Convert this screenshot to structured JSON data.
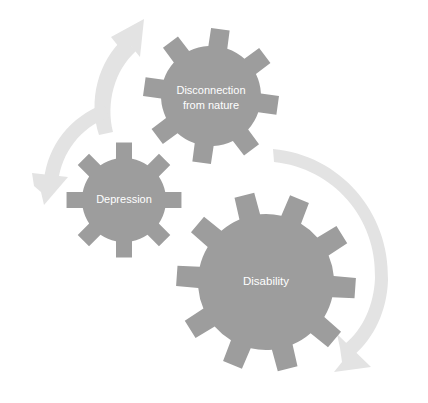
{
  "figure": {
    "name": "cycle-of-disconnection-depression-disability",
    "type": "cyclical-gear-diagram",
    "background_color": "#ffffff"
  },
  "colors": {
    "gear_fill": "#9d9d9d",
    "arrow_fill": "#e3e3e3",
    "label_text": "#ffffff"
  },
  "gears": [
    {
      "id": "gear-disconnection",
      "label": "Disconnection\nfrom nature",
      "label_line1": "Disconnection",
      "label_line2": "from nature",
      "teeth": 8,
      "center_x": 211,
      "center_y": 96,
      "body_radius": 50,
      "tooth_length": 18,
      "tooth_half_angle_deg": 11,
      "rotation_deg": 8,
      "size": "medium"
    },
    {
      "id": "gear-depression",
      "label": "Depression",
      "label_line1": "Depression",
      "label_line2": "",
      "teeth": 8,
      "center_x": 124,
      "center_y": 200,
      "body_radius": 42,
      "tooth_length": 16,
      "tooth_half_angle_deg": 11,
      "rotation_deg": 0,
      "size": "small"
    },
    {
      "id": "gear-disability",
      "label": "Disability",
      "label_line1": "Disability",
      "label_line2": "",
      "teeth": 10,
      "center_x": 266,
      "center_y": 282,
      "body_radius": 68,
      "tooth_length": 22,
      "tooth_half_angle_deg": 9,
      "rotation_deg": 4,
      "size": "large"
    }
  ],
  "arrows": [
    {
      "id": "arrow-depression-to-disconnection",
      "name": "arrow-up-right",
      "direction": "up-right",
      "start_x": 97,
      "start_y": 133,
      "end_x": 142,
      "end_y": 27
    },
    {
      "id": "arrow-disconnection-to-depression",
      "name": "arrow-down-left",
      "direction": "down-left",
      "start_x": 104,
      "start_y": 104,
      "end_x": 40,
      "end_y": 199
    },
    {
      "id": "arrow-disability-cycle",
      "name": "arrow-right-sweep-down",
      "direction": "clockwise-right",
      "start_x": 273,
      "start_y": 149,
      "end_x": 369,
      "end_y": 362
    }
  ]
}
